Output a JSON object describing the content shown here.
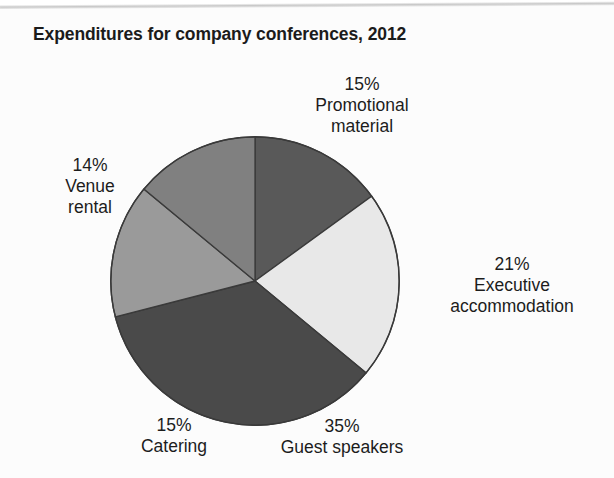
{
  "chart_data": {
    "type": "pie",
    "title": "Expenditures for company conferences, 2012",
    "xlabel": "",
    "ylabel": "",
    "legend": "none",
    "grid": false,
    "units": "percent",
    "start_angle_deg": 0,
    "direction": "clockwise",
    "categories": [
      "Promotional material",
      "Executive accommodation",
      "Guest speakers",
      "Catering",
      "Venue rental"
    ],
    "values": [
      15,
      21,
      35,
      15,
      14
    ],
    "slices": [
      {
        "label": "Promotional material",
        "value": 15,
        "percent_text": "15%",
        "color": "#595959",
        "label_lines": [
          "15%",
          "Promotional",
          "material"
        ]
      },
      {
        "label": "Executive accommodation",
        "value": 21,
        "percent_text": "21%",
        "color": "#e8e8e8",
        "label_lines": [
          "21%",
          "Executive",
          "accommodation"
        ]
      },
      {
        "label": "Guest speakers",
        "value": 35,
        "percent_text": "35%",
        "color": "#4a4a4a",
        "label_lines": [
          "35%",
          "Guest speakers"
        ]
      },
      {
        "label": "Catering",
        "value": 15,
        "percent_text": "15%",
        "color": "#9a9a9a",
        "label_lines": [
          "15%",
          "Catering"
        ]
      },
      {
        "label": "Venue rental",
        "value": 14,
        "percent_text": "14%",
        "color": "#808080",
        "label_lines": [
          "14%",
          "Venue",
          "rental"
        ]
      }
    ],
    "outline_color": "#3a3a3a",
    "background": "#fcfcfc"
  },
  "labels": {
    "promotional": "15%\nPromotional\nmaterial",
    "executive": "21%\nExecutive\naccommodation",
    "guest": "35%\nGuest speakers",
    "catering": "15%\nCatering",
    "venue": "14%\nVenue\nrental"
  }
}
